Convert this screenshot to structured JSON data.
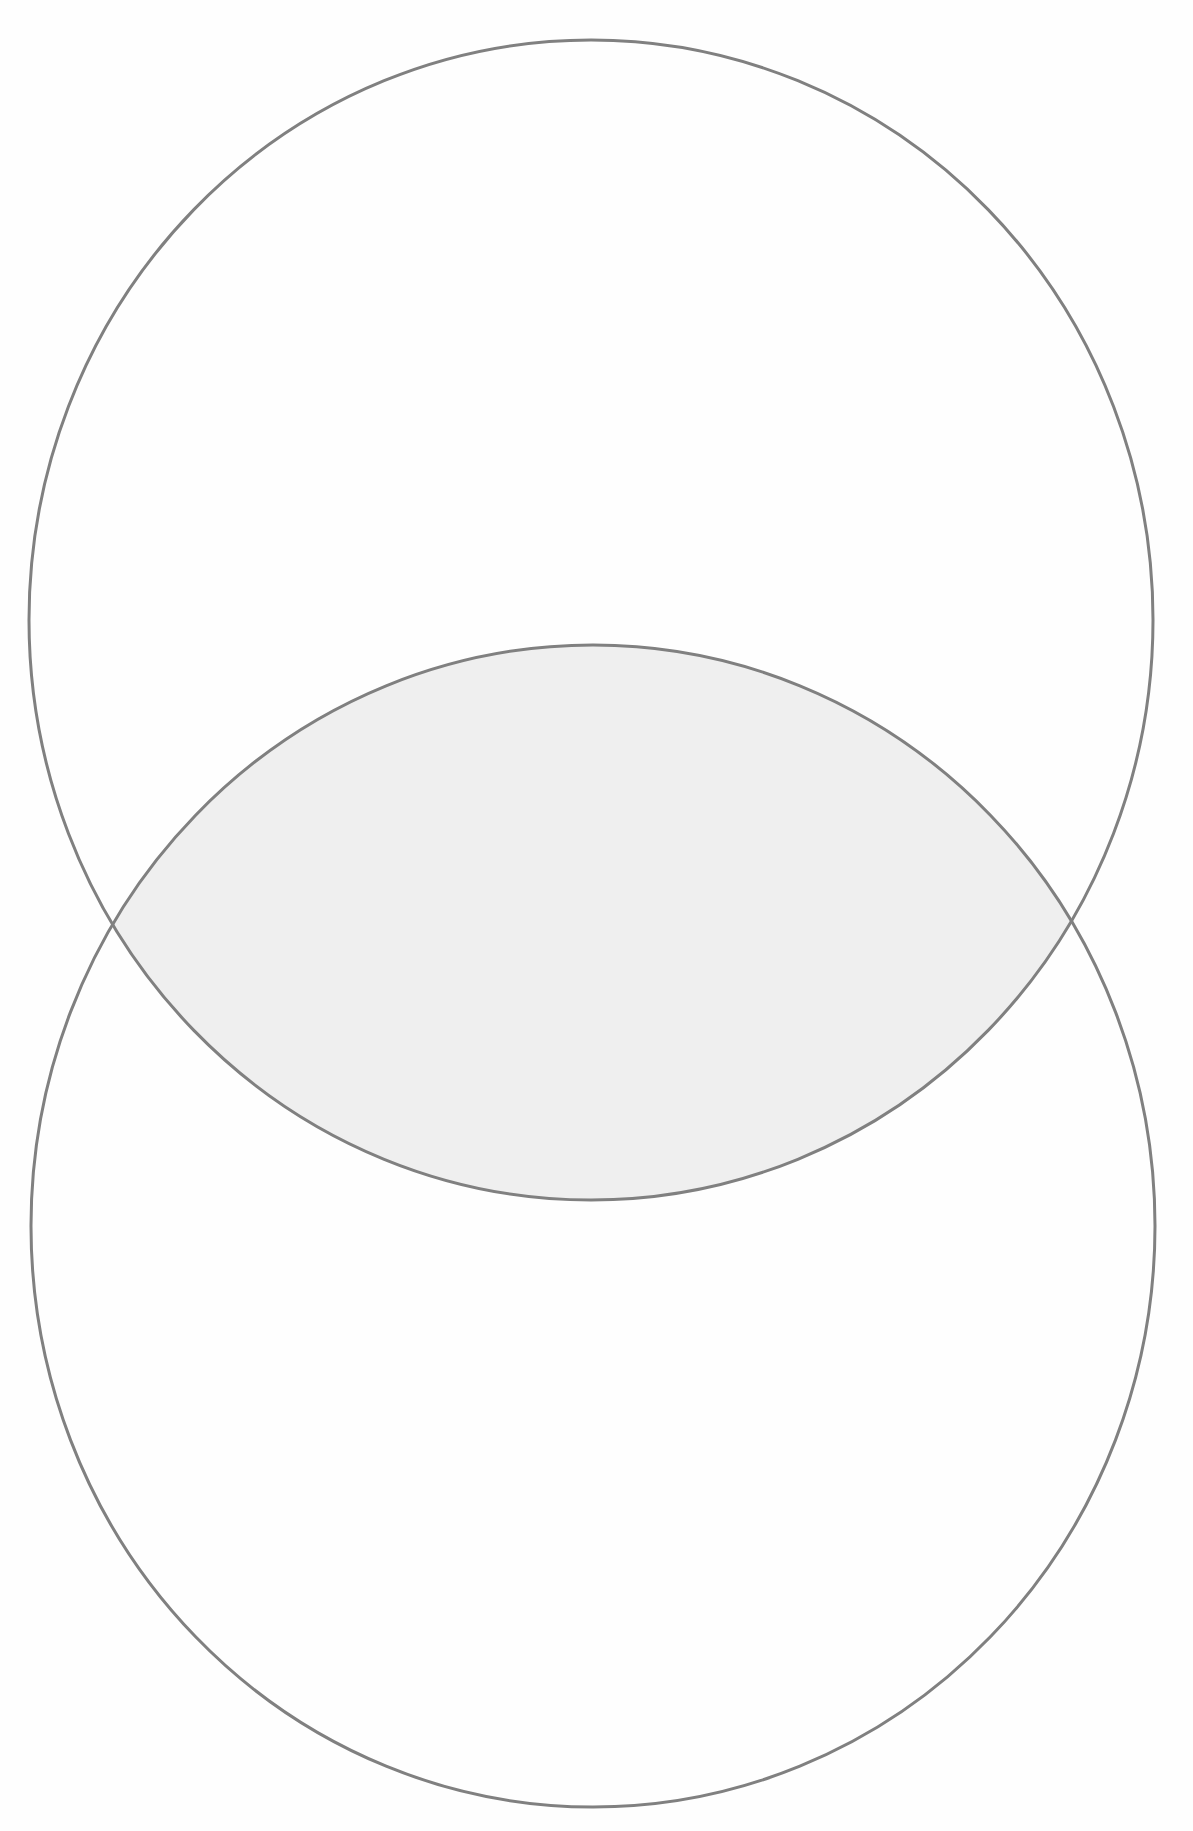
{
  "diagram": {
    "type": "venn",
    "colors": {
      "background": "#fefefe",
      "stroke": "#808080",
      "intersection_fill": "#efefef"
    },
    "stroke_width": 3,
    "shapes": [
      {
        "id": "top-circle",
        "cx": 591,
        "cy": 620,
        "rx": 562,
        "ry": 580
      },
      {
        "id": "bottom-circle",
        "cx": 593,
        "cy": 1226,
        "rx": 562,
        "ry": 581
      }
    ],
    "intersection": {
      "left_point": [
        115,
        924
      ],
      "right_point": [
        1072,
        921
      ],
      "top_y": 645,
      "bottom_y": 1200
    },
    "labels": []
  }
}
